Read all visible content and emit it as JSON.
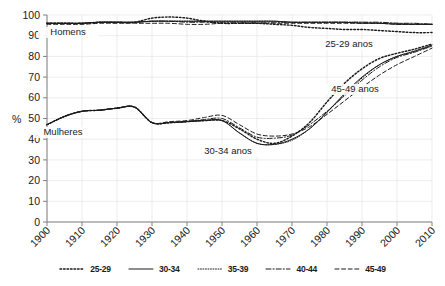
{
  "chart_data": {
    "type": "line",
    "title": "",
    "subtitle": "",
    "xlabel": "",
    "ylabel": "%",
    "xlim": [
      1900,
      2010
    ],
    "ylim": [
      0,
      100
    ],
    "ytick_step": 10,
    "xtick_step": 10,
    "grid": true,
    "legend_position": "bottom",
    "xticks": [
      "1900",
      "1910",
      "1920",
      "1930",
      "1940",
      "1950",
      "1960",
      "1970",
      "1980",
      "1990",
      "2000",
      "2010"
    ],
    "yticks": [
      "0",
      "10",
      "20",
      "30",
      "40",
      "50",
      "60",
      "70",
      "80",
      "90",
      "100"
    ],
    "x": [
      1900,
      1905,
      1910,
      1915,
      1920,
      1925,
      1930,
      1935,
      1940,
      1945,
      1950,
      1955,
      1960,
      1965,
      1970,
      1975,
      1980,
      1985,
      1990,
      1995,
      2000,
      2005,
      2010
    ],
    "groups": [
      {
        "name": "Homens",
        "annotation": "Homens",
        "series": [
          {
            "name": "25-29",
            "style": "dotted",
            "values": [
              96,
              96,
              96,
              96.5,
              96.5,
              96.5,
              98.5,
              99,
              98.5,
              97,
              96,
              96,
              96,
              95.5,
              95,
              94,
              93.5,
              93,
              93,
              92.5,
              92,
              91.5,
              91.5
            ]
          },
          {
            "name": "30-34",
            "style": "solid",
            "values": [
              96,
              96,
              96,
              96.5,
              96.5,
              96.5,
              97,
              97,
              97,
              97,
              97,
              97,
              97,
              97,
              96.5,
              96.5,
              96.5,
              96.5,
              96,
              96,
              95.5,
              95.5,
              95.5
            ]
          },
          {
            "name": "35-39",
            "style": "fine-dotted",
            "values": [
              96,
              96,
              96,
              96.5,
              96.5,
              96.5,
              97,
              97,
              97,
              97,
              97,
              97,
              97,
              97,
              96.5,
              96.5,
              96.5,
              96.5,
              96.5,
              96,
              96,
              95.5,
              95.5
            ]
          },
          {
            "name": "40-44",
            "style": "dash-dot",
            "values": [
              96,
              96,
              96,
              96.5,
              96.5,
              96.5,
              97,
              97,
              96.5,
              96.5,
              96.5,
              96.5,
              96.5,
              96.5,
              96.5,
              96.5,
              96.5,
              96.5,
              96.5,
              96.5,
              96,
              96,
              95.5
            ]
          },
          {
            "name": "45-49",
            "style": "dashed",
            "values": [
              95.5,
              95.5,
              95.5,
              96,
              96,
              96,
              96,
              96,
              95.5,
              95.5,
              96,
              96,
              96,
              96,
              96,
              96,
              96,
              96,
              96,
              96,
              95.5,
              95.5,
              95.5
            ]
          }
        ]
      },
      {
        "name": "Mulheres",
        "annotation": "Mulheres",
        "series": [
          {
            "name": "25-29",
            "style": "dotted",
            "values": [
              47,
              51,
              53.5,
              54,
              55,
              55.5,
              48,
              48,
              48.5,
              49,
              49,
              45,
              40,
              38,
              41.5,
              48,
              58,
              67,
              74,
              79,
              81.5,
              83.5,
              86
            ]
          },
          {
            "name": "30-34",
            "style": "solid",
            "values": [
              47,
              51,
              53.5,
              54,
              55,
              55.5,
              48,
              48,
              48.5,
              49,
              49,
              43,
              38,
              37.5,
              40,
              45,
              53,
              62,
              70,
              76,
              80,
              82.5,
              85.5
            ]
          },
          {
            "name": "35-39",
            "style": "fine-dotted",
            "values": [
              47,
              51,
              53.5,
              54,
              55,
              55.5,
              48,
              48,
              48.5,
              49,
              49,
              43,
              38,
              37.5,
              39.5,
              45,
              53,
              61.5,
              69.5,
              76,
              80,
              82.5,
              85
            ]
          },
          {
            "name": "40-44",
            "style": "dash-dot",
            "values": [
              47,
              51,
              53.5,
              54,
              55,
              55.5,
              48,
              48,
              48.5,
              49.5,
              50,
              45.5,
              41,
              40.5,
              42,
              47,
              53.5,
              61,
              68.5,
              75,
              79.5,
              82,
              85
            ]
          },
          {
            "name": "45-49",
            "style": "dashed",
            "values": [
              47,
              51,
              53.5,
              54,
              55,
              55.5,
              48,
              48.5,
              49,
              50.5,
              51.5,
              47,
              42.5,
              41.5,
              42.5,
              46,
              52,
              58.5,
              65,
              71,
              76,
              80,
              84
            ]
          }
        ]
      }
    ],
    "annotations": [
      {
        "text": "Homens",
        "x_px": 68,
        "y_px": 35
      },
      {
        "text": "Mulheres",
        "x_px": 63,
        "y_px": 135
      },
      {
        "text": "25-29 anos",
        "x_px": 349,
        "y_px": 47
      },
      {
        "text": "45-49 anos",
        "x_px": 355,
        "y_px": 92
      },
      {
        "text": "30-34 anos",
        "x_px": 228,
        "y_px": 154
      }
    ],
    "legend": [
      {
        "label": "25-29",
        "style": "dotted"
      },
      {
        "label": "30-34",
        "style": "solid"
      },
      {
        "label": "35-39",
        "style": "fine-dotted"
      },
      {
        "label": "40-44",
        "style": "dash-dot"
      },
      {
        "label": "45-49",
        "style": "dashed"
      }
    ]
  },
  "colors": {
    "line": "#1a1a1a",
    "axis": "#808080",
    "grid": "#e8e8e8",
    "text": "#1a1a1a",
    "background": "#ffffff"
  }
}
